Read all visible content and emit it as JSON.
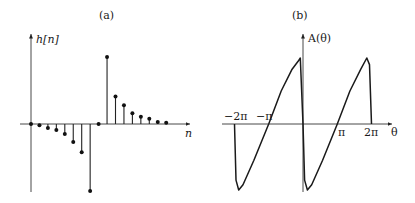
{
  "chart_data": [
    {
      "type": "stem",
      "panel_label": "(a)",
      "ylabel": "h[n]",
      "xlabel": "n",
      "grid": false,
      "x": [
        0,
        1,
        2,
        3,
        4,
        5,
        6,
        7,
        8,
        9,
        10,
        11,
        12,
        13,
        14,
        15,
        16
      ],
      "values": [
        0,
        -0.02,
        -0.06,
        -0.09,
        -0.15,
        -0.27,
        -0.42,
        -1.0,
        0,
        1.0,
        0.41,
        0.28,
        0.16,
        0.11,
        0.08,
        0.03,
        0.02
      ],
      "notes": "Odd-symmetric impulse response (approx., read off pixel heights, normalized to max |h|=1)"
    },
    {
      "type": "line",
      "panel_label": "(b)",
      "ylabel": "A(θ)",
      "xlabel": "θ",
      "grid": false,
      "xticks": [
        "−2π",
        "−π",
        "π",
        "2π"
      ],
      "xtick_values": [
        -6.283,
        -3.142,
        3.142,
        6.283
      ],
      "x": [
        -6.283,
        -6.15,
        -5.9,
        -5.5,
        -4.5,
        -3.142,
        -2.0,
        -1.0,
        -0.45,
        -0.25,
        0,
        0.15,
        0.4,
        0.8,
        1.8,
        3.142,
        4.3,
        5.3,
        5.85,
        6.1,
        6.283
      ],
      "values": [
        0,
        -0.85,
        -1.0,
        -0.92,
        -0.55,
        0,
        0.5,
        0.83,
        0.95,
        1.0,
        0,
        -0.85,
        -1.0,
        -0.92,
        -0.55,
        0,
        0.5,
        0.83,
        1.0,
        0.9,
        0
      ],
      "notes": "Sawtooth-like periodic amplitude response with period 2π, approx. values"
    }
  ],
  "panel_a": {
    "title": "(a)",
    "ylabel": "h[n]",
    "xlabel": "n"
  },
  "panel_b": {
    "title": "(b)",
    "ylabel": "A(θ)",
    "xlabel": "θ",
    "ticks": {
      "m2pi": "−2π",
      "mpi": "−π",
      "pi": "π",
      "twopi": "2π"
    }
  }
}
